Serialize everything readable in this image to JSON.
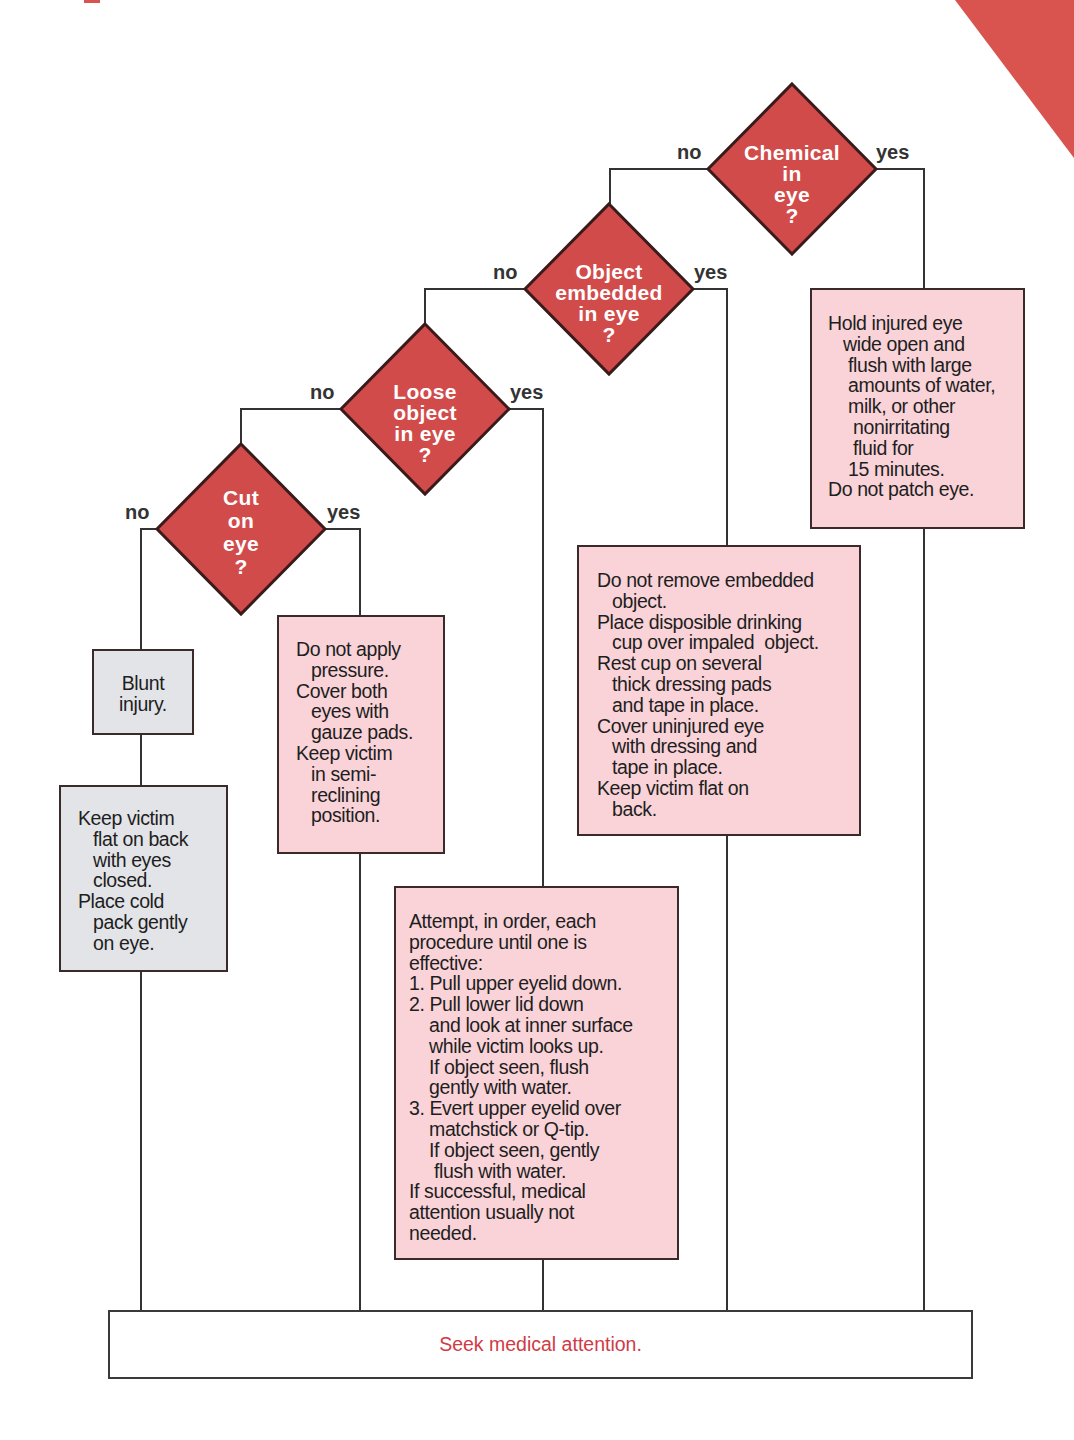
{
  "colors": {
    "diamond_fill": "#d24b4b",
    "diamond_stroke": "#3a1a1a",
    "action_box_pink": "#f9d3d8",
    "action_box_gray": "#e2e4e8",
    "seek_text": "#cf3b46",
    "corner_accent": "#d9534f"
  },
  "decisions": [
    {
      "id": "chemical",
      "lines": "Chemical\nin\neye\n?",
      "no_label": "no",
      "yes_label": "yes"
    },
    {
      "id": "embedded",
      "lines": "Object\nembedded\nin eye\n?",
      "no_label": "no",
      "yes_label": "yes"
    },
    {
      "id": "loose",
      "lines": "Loose\nobject\nin eye\n?",
      "no_label": "no",
      "yes_label": "yes"
    },
    {
      "id": "cut",
      "lines": "Cut\non\neye\n?",
      "no_label": "no",
      "yes_label": "yes"
    }
  ],
  "actions": {
    "blunt": [
      "Blunt",
      "injury."
    ],
    "blunt_care": [
      "Keep victim",
      "   flat on back",
      "   with eyes",
      "   closed.",
      "Place cold",
      "   pack gently",
      "   on eye."
    ],
    "cut_care": [
      "Do not apply",
      "   pressure.",
      "Cover both",
      "   eyes with",
      "   gauze pads.",
      "Keep victim",
      "   in semi-",
      "   reclining",
      "   position."
    ],
    "loose_care": [
      "Attempt, in order, each",
      "procedure until one is",
      "effective:",
      "1. Pull upper eyelid down.",
      "2. Pull lower lid down",
      "    and look at inner surface",
      "    while victim looks up.",
      "    If object seen, flush",
      "    gently with water.",
      "3. Evert upper eyelid over",
      "    matchstick or Q-tip.",
      "    If object seen, gently",
      "     flush with water.",
      "If successful, medical",
      "attention usually not",
      "needed."
    ],
    "embedded_care": [
      "Do not remove embedded",
      "   object.",
      "Place disposible drinking",
      "   cup over impaled  object.",
      "Rest cup on several",
      "   thick dressing pads",
      "   and tape in place.",
      "Cover uninjured eye",
      "   with dressing and",
      "   tape in place.",
      "Keep victim flat on",
      "   back."
    ],
    "chemical_care": [
      "Hold injured eye",
      "   wide open and",
      "    flush with large",
      "    amounts of water,",
      "    milk, or other",
      "     nonirritating",
      "     fluid for",
      "    15 minutes.",
      "Do not patch eye."
    ]
  },
  "final": {
    "label": "Seek medical attention."
  }
}
